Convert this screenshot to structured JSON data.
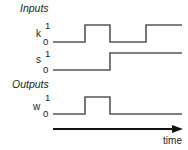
{
  "diagram": {
    "type": "timing-diagram",
    "sections": {
      "inputs_label": "Inputs",
      "outputs_label": "Outputs"
    },
    "signals": [
      {
        "name": "k",
        "high_label": "1",
        "low_label": "0",
        "transitions": [
          0,
          1,
          0,
          1
        ]
      },
      {
        "name": "s",
        "high_label": "1",
        "low_label": "0",
        "transitions": [
          0,
          0,
          1,
          1
        ]
      },
      {
        "name": "w",
        "high_label": "1",
        "low_label": "0",
        "transitions": [
          0,
          1,
          0,
          0
        ]
      }
    ],
    "time_axis_label": "time",
    "colors": {
      "waveform": "#555555",
      "text": "#222222",
      "axis": "#111111"
    }
  }
}
